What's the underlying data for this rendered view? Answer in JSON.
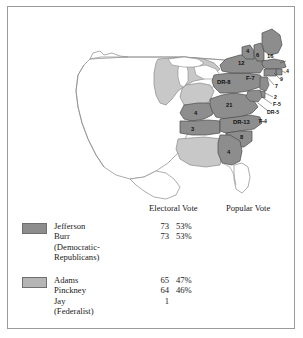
{
  "map": {
    "title": "United States electoral map, election of 1800",
    "colors": {
      "democratic_republican": "#8d8d8d",
      "federalist": "#c8c8c8",
      "unorganized": "#ffffff",
      "outline": "#8a8a8a",
      "border": "#9a9a9a"
    },
    "state_labels": [
      {
        "name": "massachusetts",
        "text": "16",
        "x": 259,
        "y": 51,
        "size": "md"
      },
      {
        "name": "new-hampshire",
        "text": "6",
        "x": 248,
        "y": 50,
        "size": "md"
      },
      {
        "name": "vermont",
        "text": "4",
        "x": 238,
        "y": 46,
        "size": "md"
      },
      {
        "name": "new-york",
        "text": "12",
        "x": 231,
        "y": 57,
        "size": "md"
      },
      {
        "name": "rhode-island",
        "text": "4",
        "x": 271,
        "y": 63,
        "size": "sm"
      },
      {
        "name": "connecticut",
        "text": "9",
        "x": 265,
        "y": 71,
        "size": "sm"
      },
      {
        "name": "pennsylvania-dr",
        "text": "DR-8",
        "x": 213,
        "y": 76,
        "size": "md"
      },
      {
        "name": "pennsylvania-f",
        "text": "F-7",
        "x": 240,
        "y": 70,
        "size": "md"
      },
      {
        "name": "new-jersey",
        "text": "7",
        "x": 262,
        "y": 80,
        "size": "sm"
      },
      {
        "name": "delaware",
        "text": "2",
        "x": 262,
        "y": 89,
        "size": "sm"
      },
      {
        "name": "maryland-f",
        "text": "F-5",
        "x": 261,
        "y": 95,
        "size": "sm"
      },
      {
        "name": "maryland-dr",
        "text": "DR-5",
        "x": 256,
        "y": 103,
        "size": "sm"
      },
      {
        "name": "virginia",
        "text": "21",
        "x": 219,
        "y": 99,
        "size": "md"
      },
      {
        "name": "north-carolina-dr",
        "text": "DR-13",
        "x": 230,
        "y": 115,
        "size": "md"
      },
      {
        "name": "north-carolina-f",
        "text": "F-4",
        "x": 256,
        "y": 114,
        "size": "sm"
      },
      {
        "name": "south-carolina",
        "text": "8",
        "x": 233,
        "y": 129,
        "size": "md"
      },
      {
        "name": "georgia",
        "text": "4",
        "x": 220,
        "y": 144,
        "size": "md"
      },
      {
        "name": "kentucky",
        "text": "4",
        "x": 186,
        "y": 107,
        "size": "md"
      },
      {
        "name": "tennessee",
        "text": "3",
        "x": 183,
        "y": 123,
        "size": "md"
      }
    ]
  },
  "legend": {
    "headers": {
      "electoral": "Electoral Vote",
      "popular": "Popular Vote"
    },
    "parties": [
      {
        "key": "democratic-republicans",
        "swatch_color": "#8d8d8d",
        "name_lines": [
          "Jefferson",
          "Burr",
          "(Democratic-",
          "Republicans)"
        ],
        "electoral": [
          {
            "votes": "73",
            "pct": "53%"
          },
          {
            "votes": "73",
            "pct": "53%"
          }
        ],
        "popular": []
      },
      {
        "key": "federalist",
        "swatch_color": "#b5b5b5",
        "name_lines": [
          "Adams",
          "Pinckney",
          "Jay",
          "(Federalist)"
        ],
        "electoral": [
          {
            "votes": "65",
            "pct": "47%"
          },
          {
            "votes": "64",
            "pct": "46%"
          },
          {
            "votes": "1",
            "pct": ""
          }
        ],
        "popular": []
      }
    ]
  }
}
